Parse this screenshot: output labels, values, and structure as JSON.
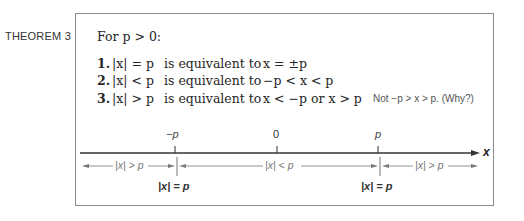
{
  "theorem": {
    "label": "THEOREM 3",
    "condition": "For p > 0:",
    "condition_parts": {
      "prefix": "For ",
      "var": "p",
      "rest": " > 0:"
    },
    "items": [
      {
        "number": "1.",
        "lhs": "|x| = p",
        "connector": "is equivalent to",
        "rhs": "x = ±p"
      },
      {
        "number": "2.",
        "lhs": "|x| < p",
        "connector": "is equivalent to",
        "rhs": "−p < x < p"
      },
      {
        "number": "3.",
        "lhs": "|x| > p",
        "connector": "is equivalent to",
        "rhs": "x < −p or x > p"
      }
    ],
    "note": "Not −p > x > p. (Why?)"
  },
  "number_line": {
    "axis_label": "x",
    "ticks": [
      {
        "label": "−p",
        "x": 175
      },
      {
        "label": "0",
        "x": 277
      },
      {
        "label": "p",
        "x": 378
      }
    ],
    "regions": [
      {
        "label": "|x| > p",
        "side": "left"
      },
      {
        "label": "|x| < p",
        "side": "middle"
      },
      {
        "label": "|x| > p",
        "side": "right"
      }
    ],
    "boundary_labels": [
      {
        "label": "|x| = p",
        "at": "−p"
      },
      {
        "label": "|x| = p",
        "at": "p"
      }
    ]
  },
  "colors": {
    "border": "#8a8a8a",
    "text": "#262626",
    "axis": "#333333",
    "range_arrow": "#888888"
  }
}
